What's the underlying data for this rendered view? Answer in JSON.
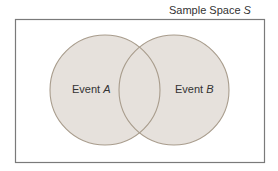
{
  "diagram": {
    "type": "venn",
    "title": "Sample Space S",
    "title_prefix": "Sample Space ",
    "title_var": "S",
    "sets": [
      {
        "name": "Event A",
        "prefix": "Event ",
        "var": "A"
      },
      {
        "name": "Event B",
        "prefix": "Event ",
        "var": "B"
      }
    ],
    "colors": {
      "fill": "#e6e1dc",
      "stroke": "#a89c8c",
      "border": "#7a7a7a",
      "text": "#333333"
    }
  }
}
